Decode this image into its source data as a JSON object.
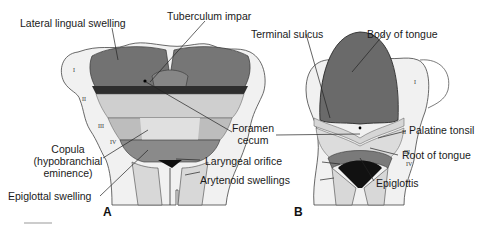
{
  "figure": {
    "topic": "Development of the tongue",
    "panels": [
      {
        "letter": "A",
        "labels": {
          "lateral_lingual_swelling": "Lateral lingual swelling",
          "tuberculum_impar": "Tuberculum impar",
          "copula_line1": "Copula",
          "copula_line2": "(hypobranchial",
          "copula_line3": "eminence)",
          "epiglottal_swelling": "Epiglottal swelling"
        },
        "arch_numerals": [
          "I",
          "II",
          "III",
          "IV"
        ]
      },
      {
        "letter": "B",
        "labels": {
          "terminal_sulcus": "Terminal sulcus",
          "body_of_tongue": "Body of tongue",
          "palatine_tonsil": "Palatine tonsil",
          "root_of_tongue": "Root of tongue",
          "epiglottis": "Epiglottis"
        },
        "arch_numerals": [
          "I",
          "II",
          "III",
          "IV"
        ]
      }
    ],
    "shared_labels": {
      "foramen_cecum_line1": "Foramen",
      "foramen_cecum_line2": "cecum",
      "laryngeal_orifice": "Laryngeal orifice",
      "arytenoid_swellings": "Arytenoid swellings"
    },
    "colors": {
      "tissue_light": "#e9e9e9",
      "tissue_mid": "#b5b5b5",
      "tongue_dark": "#6f6f6f",
      "outline": "#333333",
      "leader_line": "#222222"
    }
  }
}
